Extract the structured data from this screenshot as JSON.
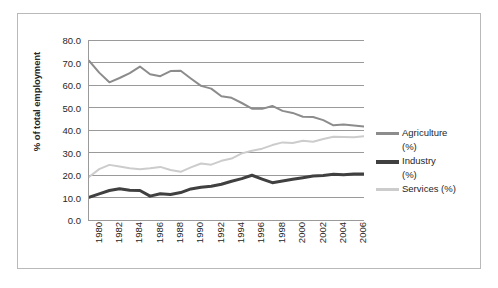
{
  "chart_data": {
    "type": "line",
    "title": "",
    "xlabel": "",
    "ylabel": "% of total employment",
    "xlim": [
      1980,
      2007
    ],
    "ylim": [
      0,
      80
    ],
    "ytick_step": 10,
    "grid": "horizontal",
    "legend_position": "right",
    "x": [
      1980,
      1981,
      1982,
      1983,
      1984,
      1985,
      1986,
      1987,
      1988,
      1989,
      1990,
      1991,
      1992,
      1993,
      1994,
      1995,
      1996,
      1997,
      1998,
      1999,
      2000,
      2001,
      2002,
      2003,
      2004,
      2005,
      2006,
      2007
    ],
    "xtick_labels": [
      "1980",
      "1982",
      "1984",
      "1986",
      "1988",
      "1990",
      "1992",
      "1994",
      "1996",
      "1998",
      "2000",
      "2002",
      "2004",
      "2006"
    ],
    "ytick_labels": [
      "0.0",
      "10.0",
      "20.0",
      "30.0",
      "40.0",
      "50.0",
      "60.0",
      "70.0",
      "80.0"
    ],
    "series": [
      {
        "name": "Agriculture (%)",
        "color": "#8c8c8c",
        "width": 2.0,
        "values": [
          70.8,
          65.5,
          61.2,
          63.1,
          65.3,
          68.2,
          64.8,
          63.9,
          66.2,
          66.3,
          62.9,
          59.6,
          58.4,
          55.0,
          54.3,
          52.0,
          49.5,
          49.4,
          50.7,
          48.5,
          47.6,
          45.9,
          45.8,
          44.4,
          42.1,
          42.4,
          42.0,
          41.5
        ]
      },
      {
        "name": "Industry (%)",
        "color": "#404040",
        "width": 3.0,
        "values": [
          10.1,
          11.6,
          13.1,
          13.9,
          13.2,
          13.1,
          10.6,
          11.7,
          11.3,
          12.2,
          13.8,
          14.6,
          15.0,
          15.9,
          17.2,
          18.4,
          19.9,
          18.2,
          16.6,
          17.3,
          18.1,
          18.8,
          19.6,
          19.8,
          20.3,
          20.1,
          20.4,
          20.5
        ]
      },
      {
        "name": "Services (%)",
        "color": "#cccccc",
        "width": 2.0,
        "values": [
          19.1,
          22.6,
          24.5,
          23.8,
          23.0,
          22.6,
          23.0,
          23.6,
          22.2,
          21.4,
          23.4,
          25.1,
          24.6,
          26.3,
          27.3,
          29.6,
          30.8,
          31.7,
          33.3,
          34.5,
          34.2,
          35.2,
          34.8,
          36.0,
          37.0,
          36.9,
          36.8,
          37.2
        ]
      }
    ]
  },
  "legend": {
    "items": [
      {
        "label": "Agriculture\n(%)",
        "color": "#8c8c8c",
        "thickness": "3px"
      },
      {
        "label": "Industry\n(%)",
        "color": "#404040",
        "thickness": "4px"
      },
      {
        "label": "Services (%)",
        "color": "#cccccc",
        "thickness": "3px"
      }
    ]
  },
  "axes": {
    "y_title": "% of total employment"
  }
}
